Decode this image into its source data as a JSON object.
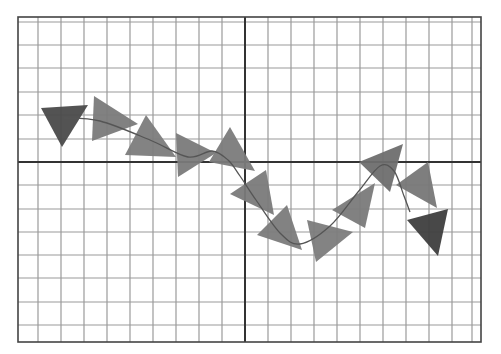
{
  "diagram": {
    "type": "trajectory-with-triangle-markers",
    "background": "#ffffff",
    "plot_area": {
      "left": 18,
      "top": 17,
      "right": 481,
      "bottom": 342
    },
    "grid": {
      "minor_color": "#9a9a9a",
      "border_color": "#444444",
      "axis_color": "#333333",
      "vertical_lines_x": [
        38,
        61,
        84,
        107,
        130,
        153,
        176,
        199,
        222,
        268,
        291,
        314,
        337,
        360,
        383,
        406,
        429,
        452,
        472
      ],
      "horizontal_lines_y": [
        22,
        45,
        68,
        92,
        115,
        139,
        185,
        209,
        232,
        255,
        278,
        302,
        325
      ],
      "axis_x": 245,
      "axis_y": 162
    },
    "curve": {
      "color": "#555555",
      "points": [
        [
          64,
          118
        ],
        [
          100,
          121
        ],
        [
          150,
          140
        ],
        [
          188,
          157
        ],
        [
          212,
          151
        ],
        [
          228,
          160
        ],
        [
          240,
          176
        ],
        [
          256,
          200
        ],
        [
          280,
          233
        ],
        [
          300,
          244
        ],
        [
          330,
          226
        ],
        [
          358,
          192
        ],
        [
          380,
          166
        ],
        [
          394,
          171
        ],
        [
          404,
          196
        ],
        [
          410,
          212
        ]
      ]
    },
    "markers": [
      {
        "id": 1,
        "fill": "#4a4a4a",
        "points": [
          [
            41,
            108
          ],
          [
            88,
            105
          ],
          [
            62,
            147
          ]
        ]
      },
      {
        "id": 2,
        "fill": "#7a7a7a",
        "points": [
          [
            94,
            96
          ],
          [
            138,
            124
          ],
          [
            92,
            141
          ]
        ]
      },
      {
        "id": 3,
        "fill": "#7c7c7c",
        "points": [
          [
            146,
            115
          ],
          [
            176,
            157
          ],
          [
            125,
            155
          ]
        ]
      },
      {
        "id": 4,
        "fill": "#7a7a7a",
        "points": [
          [
            176,
            133
          ],
          [
            216,
            153
          ],
          [
            178,
            177
          ]
        ]
      },
      {
        "id": 5,
        "fill": "#7b7b7b",
        "points": [
          [
            230,
            127
          ],
          [
            255,
            171
          ],
          [
            209,
            162
          ]
        ]
      },
      {
        "id": 6,
        "fill": "#7a7a7a",
        "points": [
          [
            266,
            170
          ],
          [
            274,
            215
          ],
          [
            230,
            194
          ]
        ]
      },
      {
        "id": 7,
        "fill": "#7b7b7b",
        "points": [
          [
            287,
            205
          ],
          [
            302,
            250
          ],
          [
            257,
            235
          ]
        ]
      },
      {
        "id": 8,
        "fill": "#7c7c7c",
        "points": [
          [
            307,
            220
          ],
          [
            353,
            232
          ],
          [
            316,
            262
          ]
        ]
      },
      {
        "id": 9,
        "fill": "#7a7a7a",
        "points": [
          [
            375,
            183
          ],
          [
            365,
            228
          ],
          [
            332,
            210
          ]
        ]
      },
      {
        "id": 10,
        "fill": "#6e6e6e",
        "points": [
          [
            403,
            144
          ],
          [
            390,
            192
          ],
          [
            359,
            162
          ]
        ]
      },
      {
        "id": 11,
        "fill": "#777777",
        "points": [
          [
            428,
            162
          ],
          [
            437,
            208
          ],
          [
            396,
            185
          ]
        ]
      },
      {
        "id": 12,
        "fill": "#3e3e3e",
        "points": [
          [
            448,
            209
          ],
          [
            438,
            256
          ],
          [
            407,
            220
          ]
        ]
      }
    ]
  }
}
